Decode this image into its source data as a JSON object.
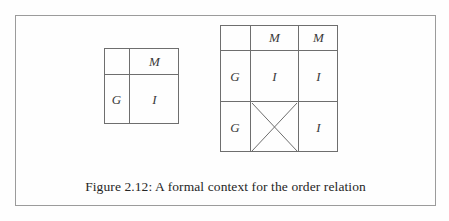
{
  "figure": {
    "caption": "Figure 2.12: A formal context for the order relation",
    "border_color": "#9b9b9b",
    "line_color": "#6e6e6e",
    "text_color": "#262626",
    "background": "#fefefe"
  },
  "table_left": {
    "name": "formal-context-table-small",
    "rows": 2,
    "cols": 2,
    "cells": [
      [
        {
          "text": "",
          "mark": "none"
        },
        {
          "text": "M",
          "mark": "none"
        }
      ],
      [
        {
          "text": "G",
          "mark": "none"
        },
        {
          "text": "I",
          "mark": "none"
        }
      ]
    ]
  },
  "table_right": {
    "name": "formal-context-table-large",
    "rows": 3,
    "cols": 3,
    "cells": [
      [
        {
          "text": "",
          "mark": "none"
        },
        {
          "text": "M",
          "mark": "none"
        },
        {
          "text": "M",
          "mark": "none"
        }
      ],
      [
        {
          "text": "G",
          "mark": "none"
        },
        {
          "text": "I",
          "mark": "none"
        },
        {
          "text": "I",
          "mark": "none"
        }
      ],
      [
        {
          "text": "G",
          "mark": "none"
        },
        {
          "text": "",
          "mark": "cross"
        },
        {
          "text": "I",
          "mark": "none"
        }
      ]
    ]
  }
}
